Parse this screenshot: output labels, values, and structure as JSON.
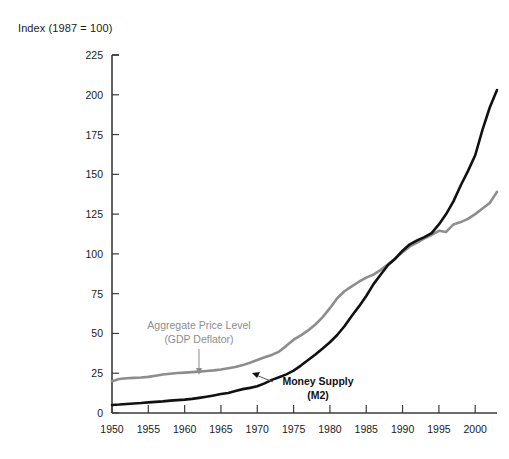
{
  "figure": {
    "axis_title": "Index (1987 = 100)",
    "background_color": "#ffffff",
    "axis_color": "#3b3b3b"
  },
  "annotations": {
    "gray_label_line1": "Aggregate Price Level",
    "gray_label_line2": "(GDP Deflator)",
    "dark_label_line1": "Money Supply",
    "dark_label_line2": "(M2)"
  },
  "chart_data": {
    "type": "line",
    "title": "Index (1987 = 100)",
    "xlabel": "",
    "ylabel": "Index (1987 = 100)",
    "xlim": [
      1950,
      2003
    ],
    "ylim": [
      0,
      225
    ],
    "yticks": [
      0,
      25,
      50,
      75,
      100,
      125,
      150,
      175,
      200,
      225
    ],
    "xticks": [
      1950,
      1955,
      1960,
      1965,
      1970,
      1975,
      1980,
      1985,
      1990,
      1995,
      2000
    ],
    "grid": false,
    "legend_position": "inline-annotations",
    "x": [
      1950,
      1951,
      1952,
      1953,
      1954,
      1955,
      1956,
      1957,
      1958,
      1959,
      1960,
      1961,
      1962,
      1963,
      1964,
      1965,
      1966,
      1967,
      1968,
      1969,
      1970,
      1971,
      1972,
      1973,
      1974,
      1975,
      1976,
      1977,
      1978,
      1979,
      1980,
      1981,
      1982,
      1983,
      1984,
      1985,
      1986,
      1987,
      1988,
      1989,
      1990,
      1991,
      1992,
      1993,
      1994,
      1995,
      1996,
      1997,
      1998,
      1999,
      2000,
      2001,
      2002,
      2003
    ],
    "series": [
      {
        "name": "Aggregate Price Level (GDP Deflator)",
        "color": "#8d8d8d",
        "values": [
          20.0,
          21.4,
          21.8,
          22.1,
          22.3,
          22.7,
          23.4,
          24.2,
          24.7,
          25.1,
          25.4,
          25.7,
          26.0,
          26.4,
          26.8,
          27.3,
          28.1,
          28.9,
          30.1,
          31.6,
          33.3,
          35.0,
          36.5,
          38.6,
          42.2,
          46.1,
          48.8,
          51.9,
          55.6,
          60.3,
          65.9,
          72.1,
          76.5,
          79.6,
          82.5,
          85.1,
          87.0,
          90.0,
          93.5,
          97.2,
          101.0,
          104.7,
          107.1,
          109.7,
          112.0,
          114.5,
          113.8,
          118.5,
          120.0,
          122.0,
          125.0,
          128.5,
          132.0,
          139.0
        ]
      },
      {
        "name": "Money Supply (M2)",
        "color": "#111111",
        "values": [
          5.0,
          5.3,
          5.7,
          6.0,
          6.3,
          6.7,
          7.0,
          7.3,
          7.8,
          8.1,
          8.4,
          8.9,
          9.5,
          10.2,
          11.0,
          11.9,
          12.6,
          13.8,
          15.0,
          15.8,
          16.8,
          18.6,
          20.8,
          22.5,
          24.3,
          26.6,
          29.8,
          33.3,
          36.8,
          40.5,
          44.5,
          49.0,
          54.5,
          61.0,
          67.0,
          73.5,
          81.0,
          87.0,
          93.0,
          97.0,
          102.0,
          106.0,
          108.5,
          110.5,
          113.0,
          118.5,
          125.0,
          133.0,
          143.0,
          152.0,
          162.0,
          178.0,
          192.0,
          203.0
        ]
      }
    ]
  }
}
